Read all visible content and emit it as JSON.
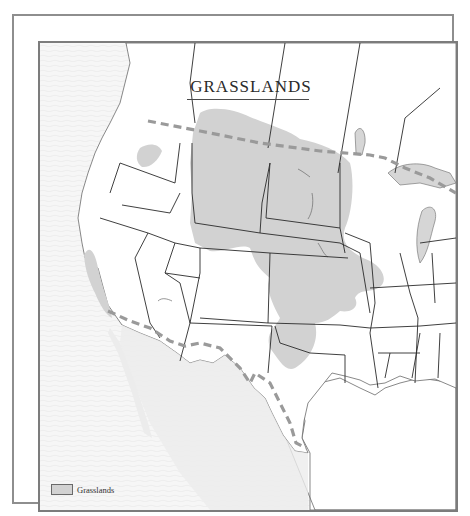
{
  "map": {
    "title": "GRASSLANDS",
    "legend": {
      "items": [
        {
          "label": "Grasslands",
          "swatch_color": "#d2d2d2"
        }
      ]
    },
    "colors": {
      "grassland_fill": "#d2d2d2",
      "border_dashed": "#9a9a9a",
      "state_lines": "#2a2a2a",
      "ocean": "#f4f4f4",
      "land": "#ffffff",
      "frame": "#8e8e8e"
    }
  }
}
